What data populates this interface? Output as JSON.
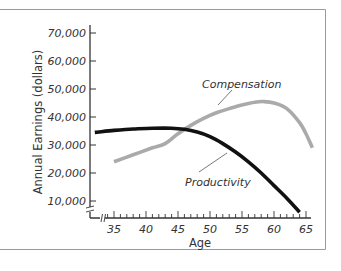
{
  "chart_data": {
    "type": "line",
    "title": "",
    "xlabel": "Age",
    "ylabel": "Annual Earnings (dollars)",
    "xlim": [
      33,
      66
    ],
    "ylim": [
      0,
      72000
    ],
    "x_ticks": [
      35,
      40,
      45,
      50,
      55,
      60,
      65
    ],
    "x_tick_labels": [
      "35",
      "40",
      "45",
      "50",
      "55",
      "60",
      "65"
    ],
    "y_ticks": [
      10000,
      20000,
      30000,
      40000,
      50000,
      60000,
      70000
    ],
    "y_tick_labels": [
      "10,000",
      "20,000",
      "30,000",
      "40,000",
      "50,000",
      "60,000",
      "70,000"
    ],
    "grid": false,
    "legend": "none (inline annotations)",
    "axis_breaks": [
      "x",
      "y"
    ],
    "series": [
      {
        "name": "Productivity",
        "color": "#111111",
        "x": [
          32,
          35,
          38,
          41,
          44,
          46,
          48,
          50,
          52,
          54,
          56,
          58,
          60,
          62,
          64
        ],
        "y": [
          34500,
          35200,
          35700,
          36000,
          36000,
          35600,
          34600,
          33000,
          30500,
          27500,
          24000,
          20000,
          15500,
          11000,
          6000
        ]
      },
      {
        "name": "Compensation",
        "color": "#aaaaaa",
        "x": [
          35,
          38,
          41,
          43,
          45,
          47,
          49,
          51,
          53,
          55,
          57,
          58.5,
          60,
          62,
          64,
          65,
          66
        ],
        "y": [
          24000,
          26500,
          29000,
          30500,
          34000,
          37000,
          39500,
          41500,
          43000,
          44300,
          45300,
          45500,
          45000,
          43000,
          38000,
          34000,
          29000
        ]
      }
    ],
    "annotations": [
      {
        "text": "Compensation",
        "series": "Compensation"
      },
      {
        "text": "Productivity",
        "series": "Productivity"
      }
    ]
  },
  "labels": {
    "ylabel": "Annual Earnings (dollars)",
    "xlabel": "Age",
    "compensation": "Compensation",
    "productivity": "Productivity"
  }
}
